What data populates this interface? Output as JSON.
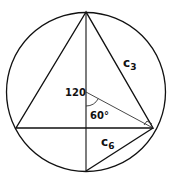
{
  "diagram": {
    "labels": {
      "center": "120",
      "angle": "60°",
      "side_c3": "c",
      "side_c3_sub": "3",
      "side_c6": "c",
      "side_c6_sub": "6"
    },
    "colors": {
      "stroke": "#111111",
      "background": "#ffffff"
    }
  }
}
